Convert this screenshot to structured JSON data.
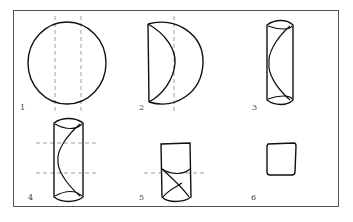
{
  "figure": {
    "steps": [
      {
        "label": "1",
        "description": "Circle with two vertical dashed fold lines"
      },
      {
        "label": "2",
        "description": "Left side folded in along dashed line"
      },
      {
        "label": "3",
        "description": "Right side folded in, forming tall strip"
      },
      {
        "label": "4",
        "description": "Tall strip with two horizontal dashed fold lines"
      },
      {
        "label": "5",
        "description": "Bottom folded up along dashed line"
      },
      {
        "label": "6",
        "description": "Final folded square"
      }
    ],
    "colors": {
      "stroke": "#111111",
      "dashed": "#777777",
      "frame": "#555555",
      "background": "#ffffff"
    }
  }
}
